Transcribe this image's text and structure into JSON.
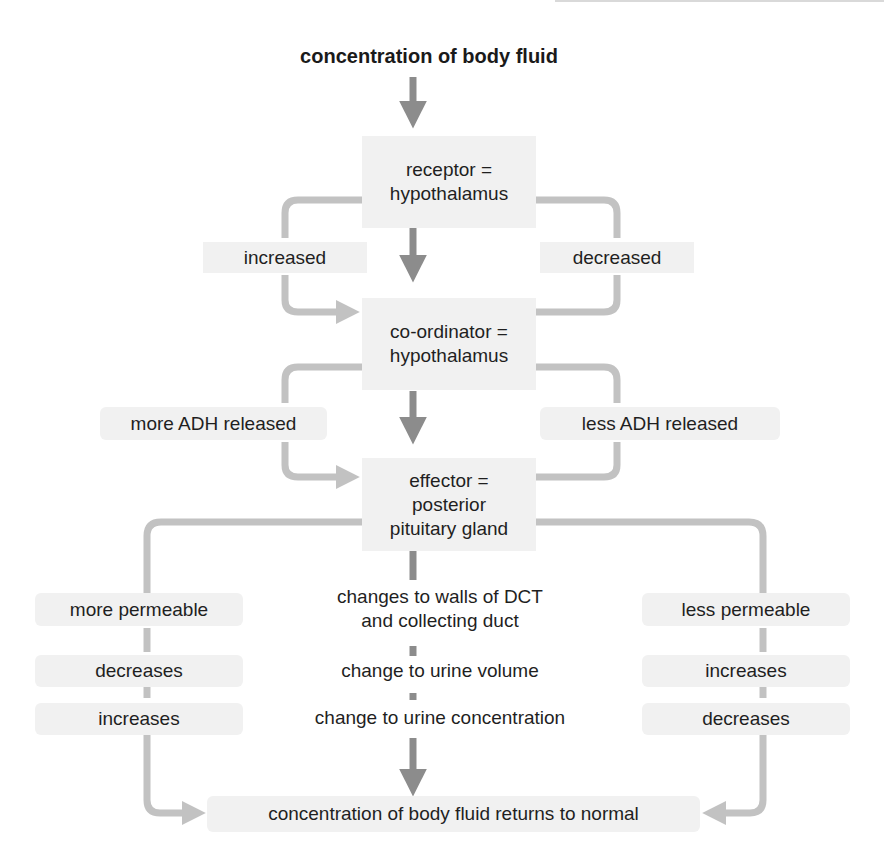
{
  "diagram": {
    "title": "concentration of body fluid",
    "colors": {
      "box_fill": "#f1f1f1",
      "main_arrow": "#8c8c8c",
      "side_arrow": "#c2c2c2",
      "text": "#1f1f1f"
    },
    "receptor": {
      "line1": "receptor =",
      "line2": "hypothalamus"
    },
    "coordinator": {
      "line1": "co-ordinator =",
      "line2": "hypothalamus"
    },
    "effector": {
      "line1": "effector =",
      "line2": "posterior",
      "line3": "pituitary gland"
    },
    "branch_left": {
      "stimulus": "increased",
      "response": "more ADH released"
    },
    "branch_right": {
      "stimulus": "decreased",
      "response": "less ADH released"
    },
    "rows": [
      {
        "center_line1": "changes to walls of DCT",
        "center_line2": "and collecting duct",
        "left": "more permeable",
        "right": "less permeable"
      },
      {
        "center": "change to urine volume",
        "left": "decreases",
        "right": "increases"
      },
      {
        "center": "change to urine concentration",
        "left": "increases",
        "right": "decreases"
      }
    ],
    "outcome": "concentration of body fluid returns to normal"
  }
}
